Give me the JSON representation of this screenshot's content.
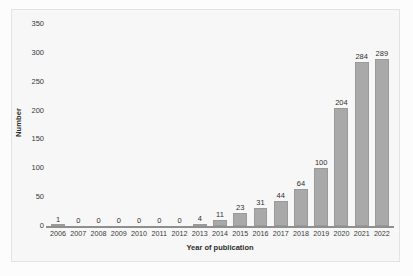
{
  "chart_data": {
    "type": "bar",
    "title": "",
    "xlabel": "Year of publication",
    "ylabel": "Number",
    "categories": [
      "2006",
      "2007",
      "2008",
      "2009",
      "2010",
      "2011",
      "2012",
      "2013",
      "2014",
      "2015",
      "2016",
      "2017",
      "2018",
      "2019",
      "2020",
      "2021",
      "2022"
    ],
    "values": [
      1,
      0,
      0,
      0,
      0,
      0,
      0,
      4,
      11,
      23,
      31,
      44,
      64,
      100,
      204,
      284,
      289
    ],
    "value_labels": [
      "1",
      "0",
      "0",
      "0",
      "0",
      "0",
      "0",
      "4",
      "11",
      "23",
      "31",
      "44",
      "64",
      "100",
      "204",
      "284",
      "289"
    ],
    "ylim": [
      0,
      350
    ],
    "yticks": [
      0,
      50,
      100,
      150,
      200,
      250,
      300,
      350
    ],
    "ytick_labels": [
      "0",
      "50",
      "100",
      "150",
      "200",
      "250",
      "300",
      "350"
    ],
    "grid": false,
    "legend": null,
    "bar_color": "#a9a9a9",
    "plot_background": "#f7f7f7",
    "axis_color": "#8f8f8f"
  }
}
